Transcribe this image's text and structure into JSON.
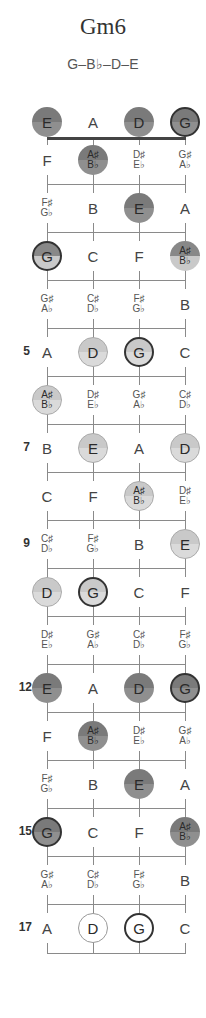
{
  "chord": {
    "name": "Gm6",
    "notes": "G–B♭–D–E"
  },
  "layout": {
    "strings_x": [
      47,
      93,
      139,
      185
    ],
    "open_y": 122,
    "fret1_y": 160,
    "fret_spacing": 48,
    "bottom_line_y": 953
  },
  "colors": {
    "dark_dot": "#7a7a7a",
    "light_dot": "#d2d2d2",
    "root_ring": "#333333",
    "lines": "#8a8a8a",
    "nut": "#444444"
  },
  "fret_numbers": [
    {
      "fret": 5,
      "label": "5"
    },
    {
      "fret": 7,
      "label": "7"
    },
    {
      "fret": 9,
      "label": "9"
    },
    {
      "fret": 12,
      "label": "12"
    },
    {
      "fret": 15,
      "label": "15"
    },
    {
      "fret": 17,
      "label": "17"
    }
  ],
  "rows": [
    {
      "fret": 0,
      "cells": [
        {
          "n1": "E",
          "style": "dark"
        },
        {
          "n1": "A"
        },
        {
          "n1": "D",
          "style": "dark"
        },
        {
          "n1": "G",
          "style": "dark",
          "root": true
        }
      ]
    },
    {
      "fret": 1,
      "cells": [
        {
          "n1": "F"
        },
        {
          "n1": "A♯",
          "n2": "B♭",
          "style": "dark"
        },
        {
          "n1": "D♯",
          "n2": "E♭"
        },
        {
          "n1": "G♯",
          "n2": "A♭"
        }
      ]
    },
    {
      "fret": 2,
      "cells": [
        {
          "n1": "F♯",
          "n2": "G♭"
        },
        {
          "n1": "B"
        },
        {
          "n1": "E",
          "style": "dark"
        },
        {
          "n1": "A"
        }
      ]
    },
    {
      "fret": 3,
      "cells": [
        {
          "n1": "G",
          "style": "mid",
          "root": true
        },
        {
          "n1": "C"
        },
        {
          "n1": "F"
        },
        {
          "n1": "A♯",
          "n2": "B♭",
          "style": "mid"
        }
      ]
    },
    {
      "fret": 4,
      "cells": [
        {
          "n1": "G♯",
          "n2": "A♭"
        },
        {
          "n1": "C♯",
          "n2": "D♭"
        },
        {
          "n1": "F♯",
          "n2": "G♭"
        },
        {
          "n1": "B"
        }
      ]
    },
    {
      "fret": 5,
      "cells": [
        {
          "n1": "A"
        },
        {
          "n1": "D",
          "style": "light"
        },
        {
          "n1": "G",
          "style": "light",
          "root": true
        },
        {
          "n1": "C"
        }
      ]
    },
    {
      "fret": 6,
      "cells": [
        {
          "n1": "A♯",
          "n2": "B♭",
          "style": "light"
        },
        {
          "n1": "D♯",
          "n2": "E♭"
        },
        {
          "n1": "G♯",
          "n2": "A♭"
        },
        {
          "n1": "C♯",
          "n2": "D♭"
        }
      ]
    },
    {
      "fret": 7,
      "cells": [
        {
          "n1": "B"
        },
        {
          "n1": "E",
          "style": "light"
        },
        {
          "n1": "A"
        },
        {
          "n1": "D",
          "style": "light"
        }
      ]
    },
    {
      "fret": 8,
      "cells": [
        {
          "n1": "C"
        },
        {
          "n1": "F"
        },
        {
          "n1": "A♯",
          "n2": "B♭",
          "style": "light"
        },
        {
          "n1": "D♯",
          "n2": "E♭"
        }
      ]
    },
    {
      "fret": 9,
      "cells": [
        {
          "n1": "C♯",
          "n2": "D♭"
        },
        {
          "n1": "F♯",
          "n2": "G♭"
        },
        {
          "n1": "B"
        },
        {
          "n1": "E",
          "style": "light"
        }
      ]
    },
    {
      "fret": 10,
      "cells": [
        {
          "n1": "D",
          "style": "light"
        },
        {
          "n1": "G",
          "style": "light",
          "root": true
        },
        {
          "n1": "C"
        },
        {
          "n1": "F"
        }
      ]
    },
    {
      "fret": 11,
      "cells": [
        {
          "n1": "D♯",
          "n2": "E♭"
        },
        {
          "n1": "G♯",
          "n2": "A♭"
        },
        {
          "n1": "C♯",
          "n2": "D♭"
        },
        {
          "n1": "F♯",
          "n2": "G♭"
        }
      ]
    },
    {
      "fret": 12,
      "cells": [
        {
          "n1": "E",
          "style": "dark"
        },
        {
          "n1": "A"
        },
        {
          "n1": "D",
          "style": "dark"
        },
        {
          "n1": "G",
          "style": "dark",
          "root": true
        }
      ]
    },
    {
      "fret": 13,
      "cells": [
        {
          "n1": "F"
        },
        {
          "n1": "A♯",
          "n2": "B♭",
          "style": "dark"
        },
        {
          "n1": "D♯",
          "n2": "E♭"
        },
        {
          "n1": "G♯",
          "n2": "A♭"
        }
      ]
    },
    {
      "fret": 14,
      "cells": [
        {
          "n1": "F♯",
          "n2": "G♭"
        },
        {
          "n1": "B"
        },
        {
          "n1": "E",
          "style": "dark"
        },
        {
          "n1": "A"
        }
      ]
    },
    {
      "fret": 15,
      "cells": [
        {
          "n1": "G",
          "style": "dark",
          "root": true
        },
        {
          "n1": "C"
        },
        {
          "n1": "F"
        },
        {
          "n1": "A♯",
          "n2": "B♭",
          "style": "dark"
        }
      ]
    },
    {
      "fret": 16,
      "cells": [
        {
          "n1": "G♯",
          "n2": "A♭"
        },
        {
          "n1": "C♯",
          "n2": "D♭"
        },
        {
          "n1": "F♯",
          "n2": "G♭"
        },
        {
          "n1": "B"
        }
      ]
    },
    {
      "fret": 17,
      "cells": [
        {
          "n1": "A"
        },
        {
          "n1": "D",
          "style": "hollow"
        },
        {
          "n1": "G",
          "style": "hollow",
          "root": true
        },
        {
          "n1": "C"
        }
      ]
    }
  ]
}
